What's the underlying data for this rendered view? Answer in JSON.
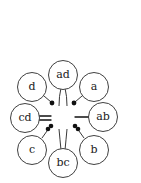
{
  "diagram": {
    "type": "ring-of-nodes",
    "center": {
      "x": 63,
      "y": 119
    },
    "nodes": [
      {
        "id": "ad",
        "label": "ad",
        "x": 63,
        "y": 75
      },
      {
        "id": "a",
        "label": "a",
        "x": 94,
        "y": 87
      },
      {
        "id": "ab",
        "label": "ab",
        "x": 103,
        "y": 117
      },
      {
        "id": "b",
        "label": "b",
        "x": 94,
        "y": 150
      },
      {
        "id": "bc",
        "label": "bc",
        "x": 63,
        "y": 163
      },
      {
        "id": "c",
        "label": "c",
        "x": 32,
        "y": 150
      },
      {
        "id": "cd",
        "label": "cd",
        "x": 25,
        "y": 118
      },
      {
        "id": "d",
        "label": "d",
        "x": 32,
        "y": 87
      }
    ],
    "connectors": [
      {
        "from": "ad",
        "kind": "double-curved-line"
      },
      {
        "from": "a",
        "kind": "single-dot"
      },
      {
        "from": "ab",
        "kind": "single-line"
      },
      {
        "from": "b",
        "kind": "double-dot"
      },
      {
        "from": "bc",
        "kind": "double-line"
      },
      {
        "from": "c",
        "kind": "double-dot"
      },
      {
        "from": "cd",
        "kind": "double-line"
      },
      {
        "from": "d",
        "kind": "single-dot"
      }
    ],
    "colors": {
      "stroke": "#2a2a2a",
      "fill": "#ffffff",
      "marks": "#111111"
    }
  }
}
